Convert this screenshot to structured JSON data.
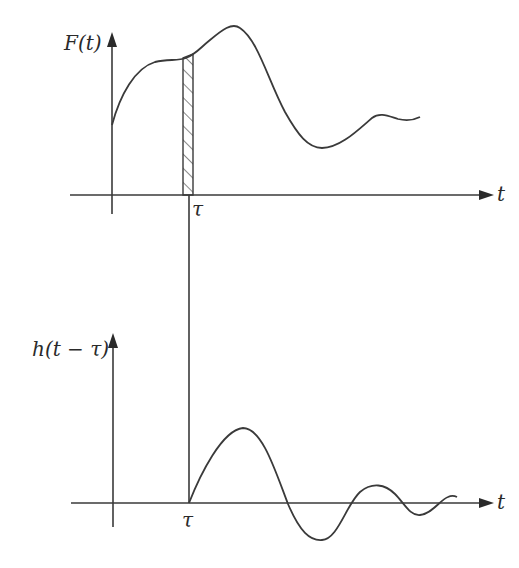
{
  "diagram": {
    "top_panel": {
      "y_axis_label": "F(t)",
      "x_axis_label": "t",
      "marker_label": "τ",
      "description": "Input function F(t) with shaded impulse strip of width dτ at t = τ"
    },
    "bottom_panel": {
      "y_axis_label": "h(t − τ)",
      "x_axis_label": "t",
      "marker_label": "τ",
      "description": "Impulse response h(t − τ) starting at t = τ, decaying oscillation"
    },
    "colors": {
      "line": "#3a3a3a",
      "background": "#ffffff"
    }
  }
}
